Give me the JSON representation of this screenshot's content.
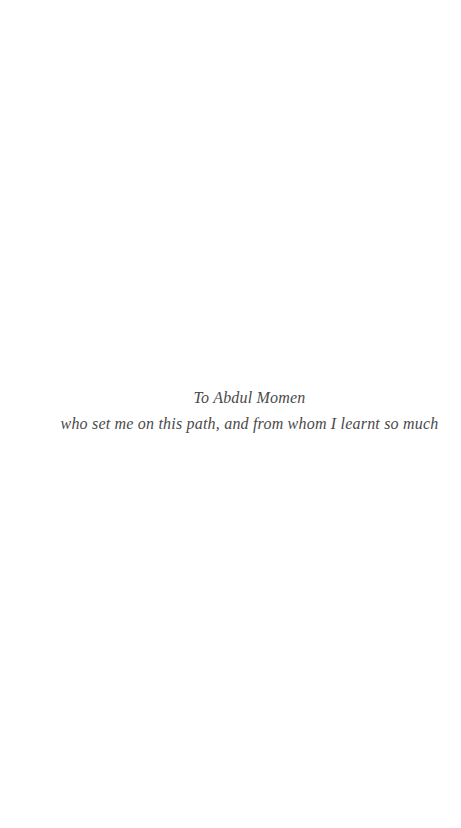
{
  "page": {
    "background_color": "#ffffff",
    "text_color": "#4a4a4a",
    "dedication": {
      "line1": "To Abdul Momen",
      "line2": "who set me on this path, and from whom I learnt so much"
    }
  }
}
